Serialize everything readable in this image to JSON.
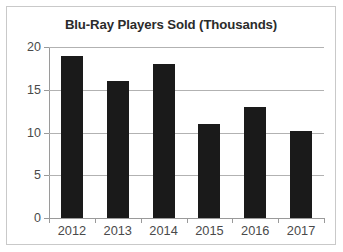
{
  "chart_data": {
    "type": "bar",
    "title": "Blu-Ray Players Sold (Thousands)",
    "xlabel": "",
    "ylabel": "",
    "categories": [
      "2012",
      "2013",
      "2014",
      "2015",
      "2016",
      "2017"
    ],
    "values": [
      19,
      16,
      18,
      11,
      13,
      10.2
    ],
    "ylim": [
      0,
      20
    ],
    "yticks": [
      0,
      5,
      10,
      15,
      20
    ],
    "ytick_labels": [
      "0",
      "5",
      "10",
      "15",
      "20"
    ],
    "grid": true,
    "legend": false,
    "legend_position": "none",
    "bar_color": "#1a1a1a",
    "gridline_color": "#b2b2b2",
    "axis_color": "#9a9a9a",
    "title_color": "#2b2b2b",
    "tick_label_color": "#4a4a4a",
    "frame_border_color": "#c9c9c9",
    "background_color": "#ffffff"
  }
}
